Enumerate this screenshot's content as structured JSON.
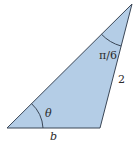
{
  "figure": {
    "type": "triangle",
    "colors": {
      "fill": "#b4cde6",
      "stroke": "#3a4656",
      "label": "#2b2b2b",
      "background": "#ffffff"
    },
    "vertices": {
      "top": [
        132,
        4
      ],
      "bottom_left": [
        7,
        128
      ],
      "bottom_right": [
        100,
        128
      ]
    },
    "labels": {
      "top_angle": "π/6",
      "bottom_left_angle": "θ",
      "right_side": "2",
      "bottom_side": "b"
    }
  }
}
